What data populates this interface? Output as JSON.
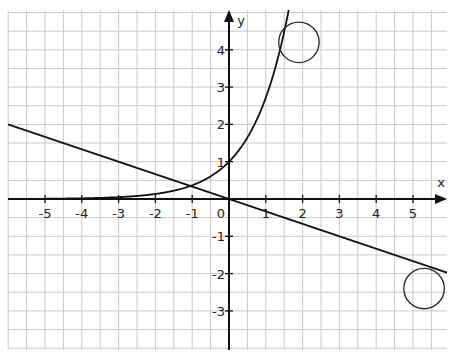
{
  "chart_data": {
    "type": "line",
    "title": "",
    "xlabel": "x",
    "ylabel": "y",
    "xlim": [
      -6.0,
      6.0
    ],
    "ylim": [
      -4.0,
      5.0
    ],
    "grid": true,
    "grid_step": 0.5,
    "x_ticks": [
      -5,
      -4,
      -3,
      -2,
      -1,
      0,
      1,
      2,
      3,
      4,
      5
    ],
    "x_tick_labels": [
      "-5",
      "-4",
      "-3",
      "-2",
      "-1",
      "0",
      "1",
      "2",
      "3",
      "4",
      "5"
    ],
    "y_ticks": [
      -3,
      -2,
      -1,
      1,
      2,
      3,
      4
    ],
    "y_tick_labels": [
      "-3",
      "-2",
      "-1",
      "1",
      "2",
      "3",
      "4"
    ],
    "origin_label": "0",
    "series": [
      {
        "name": "exponential curve",
        "equation": "y = e^x",
        "x": [
          -6,
          -5,
          -4,
          -3,
          -2,
          -1,
          0,
          0.5,
          1,
          1.3,
          1.5
        ],
        "values": [
          0.0025,
          0.0067,
          0.018,
          0.05,
          0.135,
          0.368,
          1.0,
          1.65,
          2.72,
          3.67,
          4.48
        ]
      },
      {
        "name": "straight line",
        "equation": "y = -x/3",
        "x": [
          -6,
          -3,
          0,
          3,
          6
        ],
        "values": [
          2,
          1,
          0,
          -1,
          -2
        ]
      }
    ],
    "annotations": [
      {
        "type": "circle",
        "cx": 1.9,
        "cy": 4.2,
        "r": 0.55
      },
      {
        "type": "circle",
        "cx": 5.3,
        "cy": -2.4,
        "r": 0.55
      }
    ],
    "intersection": {
      "x": -1.0,
      "y": 0.35
    }
  }
}
